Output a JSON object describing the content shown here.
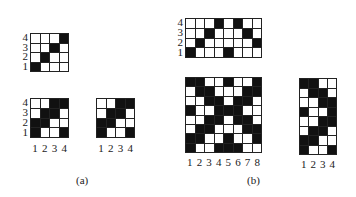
{
  "figure": {
    "captions": {
      "a": "(a)",
      "b": "(b)"
    },
    "row_labels_4": [
      "4",
      "3",
      "2",
      "1"
    ],
    "col_labels_4": [
      "1",
      "2",
      "3",
      "4"
    ],
    "col_labels_8": [
      "1",
      "2",
      "3",
      "4",
      "5",
      "6",
      "7",
      "8"
    ],
    "grids": {
      "a_top": {
        "description": "4x4 twill, rows listed top (4) to bottom (1)",
        "rows": [
          [
            0,
            0,
            0,
            1
          ],
          [
            0,
            0,
            1,
            0
          ],
          [
            0,
            1,
            0,
            0
          ],
          [
            1,
            0,
            0,
            0
          ]
        ]
      },
      "a_bottom_left": {
        "rows": [
          [
            0,
            0,
            1,
            1
          ],
          [
            0,
            1,
            1,
            0
          ],
          [
            1,
            1,
            0,
            0
          ],
          [
            1,
            0,
            0,
            1
          ]
        ]
      },
      "a_bottom_right": {
        "rows": [
          [
            0,
            0,
            1,
            1
          ],
          [
            0,
            1,
            1,
            0
          ],
          [
            1,
            1,
            0,
            0
          ],
          [
            1,
            0,
            0,
            1
          ]
        ]
      },
      "b_top": {
        "description": "8x4 grid, rows listed top (4) to bottom (1)",
        "rows": [
          [
            0,
            0,
            0,
            1,
            0,
            1,
            0,
            0
          ],
          [
            0,
            0,
            1,
            0,
            0,
            0,
            1,
            0
          ],
          [
            0,
            1,
            0,
            0,
            0,
            0,
            0,
            1
          ],
          [
            1,
            0,
            0,
            0,
            1,
            0,
            0,
            0
          ]
        ]
      },
      "b_main": {
        "description": "8x8 grid, rows listed top to bottom",
        "rows": [
          [
            1,
            1,
            0,
            0,
            1,
            0,
            0,
            1
          ],
          [
            0,
            1,
            1,
            0,
            0,
            0,
            1,
            1
          ],
          [
            0,
            0,
            1,
            1,
            0,
            1,
            1,
            0
          ],
          [
            1,
            0,
            0,
            1,
            1,
            1,
            0,
            0
          ],
          [
            0,
            0,
            1,
            1,
            0,
            1,
            1,
            0
          ],
          [
            0,
            1,
            1,
            0,
            0,
            0,
            1,
            1
          ],
          [
            1,
            1,
            0,
            0,
            1,
            0,
            0,
            1
          ],
          [
            1,
            0,
            0,
            1,
            1,
            1,
            0,
            0
          ]
        ]
      },
      "b_right": {
        "description": "4x8 grid, rows listed top to bottom",
        "rows": [
          [
            1,
            1,
            0,
            0
          ],
          [
            0,
            1,
            1,
            0
          ],
          [
            0,
            0,
            1,
            1
          ],
          [
            1,
            0,
            0,
            1
          ],
          [
            0,
            0,
            1,
            1
          ],
          [
            0,
            1,
            1,
            0
          ],
          [
            1,
            1,
            0,
            0
          ],
          [
            1,
            0,
            0,
            1
          ]
        ]
      }
    }
  }
}
